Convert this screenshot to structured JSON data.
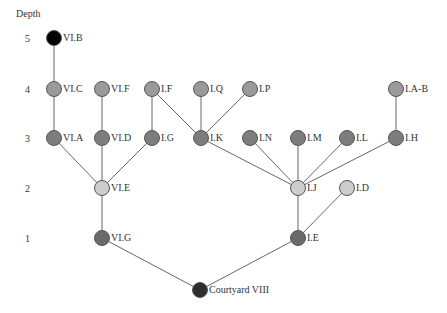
{
  "diagram": {
    "axis_title": "Depth",
    "depth_levels": [
      {
        "label": "5",
        "y": 38
      },
      {
        "label": "4",
        "y": 89
      },
      {
        "label": "3",
        "y": 138
      },
      {
        "label": "2",
        "y": 188
      },
      {
        "label": "1",
        "y": 238
      }
    ],
    "colors": {
      "root": "#2e2e2e",
      "depth1": "#6a6a6a",
      "depth2": "#cdcdcd",
      "depth3": "#7d7d7d",
      "depth4": "#9a9a9a",
      "depth5": "#000000"
    },
    "nodes": [
      {
        "id": "CourtyardVIII",
        "label": "Courtyard VIII",
        "depth": 0,
        "x": 200,
        "y": 290,
        "color": "#2e2e2e"
      },
      {
        "id": "VIG",
        "label": "VI.G",
        "depth": 1,
        "x": 102,
        "y": 238,
        "color": "#6a6a6a"
      },
      {
        "id": "IE",
        "label": "I.E",
        "depth": 1,
        "x": 298,
        "y": 238,
        "color": "#6a6a6a"
      },
      {
        "id": "VIE",
        "label": "VI.E",
        "depth": 2,
        "x": 102,
        "y": 188,
        "color": "#cdcdcd"
      },
      {
        "id": "IJ",
        "label": "I.J",
        "depth": 2,
        "x": 298,
        "y": 188,
        "color": "#cdcdcd"
      },
      {
        "id": "ID",
        "label": "I.D",
        "depth": 2,
        "x": 347,
        "y": 188,
        "color": "#cdcdcd"
      },
      {
        "id": "VIA",
        "label": "VI.A",
        "depth": 3,
        "x": 54,
        "y": 138,
        "color": "#7d7d7d"
      },
      {
        "id": "VID",
        "label": "VI.D",
        "depth": 3,
        "x": 102,
        "y": 138,
        "color": "#7d7d7d"
      },
      {
        "id": "IG",
        "label": "I.G",
        "depth": 3,
        "x": 152,
        "y": 138,
        "color": "#7d7d7d"
      },
      {
        "id": "IK",
        "label": "I.K",
        "depth": 3,
        "x": 201,
        "y": 138,
        "color": "#7d7d7d"
      },
      {
        "id": "IN",
        "label": "I.N",
        "depth": 3,
        "x": 250,
        "y": 138,
        "color": "#7d7d7d"
      },
      {
        "id": "IM",
        "label": "I.M",
        "depth": 3,
        "x": 298,
        "y": 138,
        "color": "#7d7d7d"
      },
      {
        "id": "IL",
        "label": "I.L",
        "depth": 3,
        "x": 347,
        "y": 138,
        "color": "#7d7d7d"
      },
      {
        "id": "IH",
        "label": "I.H",
        "depth": 3,
        "x": 396,
        "y": 138,
        "color": "#7d7d7d"
      },
      {
        "id": "VIC",
        "label": "VI.C",
        "depth": 4,
        "x": 54,
        "y": 89,
        "color": "#9a9a9a"
      },
      {
        "id": "VIF",
        "label": "VI.F",
        "depth": 4,
        "x": 102,
        "y": 89,
        "color": "#9a9a9a"
      },
      {
        "id": "IF",
        "label": "I.F",
        "depth": 4,
        "x": 152,
        "y": 89,
        "color": "#9a9a9a"
      },
      {
        "id": "IQ",
        "label": "I.Q",
        "depth": 4,
        "x": 201,
        "y": 89,
        "color": "#9a9a9a"
      },
      {
        "id": "IP",
        "label": "I.P",
        "depth": 4,
        "x": 250,
        "y": 89,
        "color": "#9a9a9a"
      },
      {
        "id": "IAB",
        "label": "I.A-B",
        "depth": 4,
        "x": 396,
        "y": 89,
        "color": "#9a9a9a"
      },
      {
        "id": "VIB",
        "label": "VI.B",
        "depth": 5,
        "x": 54,
        "y": 38,
        "color": "#000000"
      }
    ],
    "edges": [
      [
        "CourtyardVIII",
        "VIG"
      ],
      [
        "CourtyardVIII",
        "IE"
      ],
      [
        "VIG",
        "VIE"
      ],
      [
        "IE",
        "IJ"
      ],
      [
        "IE",
        "ID"
      ],
      [
        "VIE",
        "VIA"
      ],
      [
        "VIE",
        "VID"
      ],
      [
        "VIE",
        "IG"
      ],
      [
        "IJ",
        "IK"
      ],
      [
        "IJ",
        "IN"
      ],
      [
        "IJ",
        "IM"
      ],
      [
        "IJ",
        "IL"
      ],
      [
        "IJ",
        "IH"
      ],
      [
        "VIA",
        "VIC"
      ],
      [
        "VID",
        "VIF"
      ],
      [
        "IG",
        "IF"
      ],
      [
        "IK",
        "IF"
      ],
      [
        "IK",
        "IQ"
      ],
      [
        "IK",
        "IP"
      ],
      [
        "IH",
        "IAB"
      ],
      [
        "VIC",
        "VIB"
      ]
    ]
  }
}
